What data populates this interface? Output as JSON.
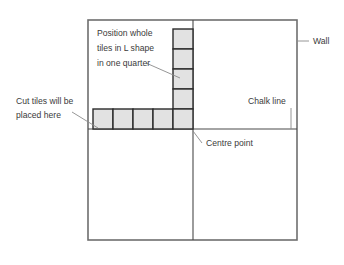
{
  "diagram": {
    "colors": {
      "wall_stroke": "#6e6e6e",
      "chalk_stroke": "#4a4a4a",
      "tile_fill": "#e2e2e2",
      "tile_stroke": "#2b2b2b",
      "leader_stroke": "#8a8a8a",
      "text": "#3a3a3a",
      "background": "#ffffff"
    },
    "room": {
      "name": "room-outline",
      "x": 88,
      "y": 20,
      "width": 209,
      "height": 220
    },
    "chalk_lines": {
      "vertical_x": 193,
      "horizontal_y": 129
    },
    "centre_point": {
      "x": 193,
      "y": 129
    },
    "tiles": {
      "size": 20,
      "fill": "#e2e2e2",
      "column": {
        "label": "vertical-tile-column",
        "x": 173,
        "count": 5,
        "top_y": 29,
        "tiles": [
          {
            "x": 173,
            "y": 29
          },
          {
            "x": 173,
            "y": 49
          },
          {
            "x": 173,
            "y": 69
          },
          {
            "x": 173,
            "y": 89
          },
          {
            "x": 173,
            "y": 109
          }
        ]
      },
      "row": {
        "label": "horizontal-tile-row",
        "y": 109,
        "count": 4,
        "tiles": [
          {
            "x": 93,
            "y": 109
          },
          {
            "x": 113,
            "y": 109
          },
          {
            "x": 133,
            "y": 109
          },
          {
            "x": 153,
            "y": 109
          }
        ]
      }
    },
    "annotations": [
      {
        "id": "position-whole-tiles",
        "name": "annotation-position-whole-tiles",
        "lines": [
          "Position whole",
          "tiles in L shape",
          "in one quarter"
        ],
        "text_x": 97,
        "text_y": 36,
        "line_height": 15,
        "anchor": "start",
        "leader": {
          "x1": 146,
          "y1": 63,
          "x2": 180,
          "y2": 78
        }
      },
      {
        "id": "cut-tiles",
        "name": "annotation-cut-tiles",
        "lines": [
          "Cut tiles will be",
          "placed here"
        ],
        "text_x": 16,
        "text_y": 104,
        "line_height": 14,
        "anchor": "start",
        "leader": {
          "x1": 72,
          "y1": 112,
          "x2": 98,
          "y2": 128
        }
      },
      {
        "id": "chalk-line",
        "name": "annotation-chalk-line",
        "lines": [
          "Chalk line"
        ],
        "text_x": 248,
        "text_y": 104,
        "line_height": 14,
        "anchor": "start",
        "leader": {
          "x1": 291,
          "y1": 108,
          "x2": 291,
          "y2": 129
        }
      },
      {
        "id": "centre-point",
        "name": "annotation-centre-point",
        "lines": [
          "Centre point"
        ],
        "text_x": 206,
        "text_y": 146,
        "line_height": 14,
        "anchor": "start",
        "leader": {
          "x1": 193,
          "y1": 131,
          "x2": 202,
          "y2": 143
        }
      },
      {
        "id": "wall",
        "name": "annotation-wall",
        "lines": [
          "Wall"
        ],
        "text_x": 313,
        "text_y": 44,
        "line_height": 14,
        "anchor": "start",
        "leader": {
          "x1": 297,
          "y1": 41,
          "x2": 309,
          "y2": 41
        }
      }
    ]
  }
}
